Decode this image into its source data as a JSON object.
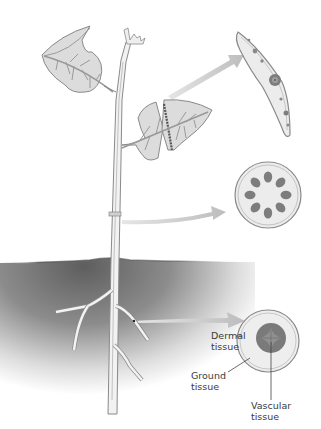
{
  "diagram": {
    "parts": [
      "leaf",
      "stem",
      "root"
    ],
    "cross_sections": [
      {
        "name": "leaf-cross-section",
        "source": "leaf"
      },
      {
        "name": "stem-cross-section",
        "source": "stem"
      },
      {
        "name": "root-cross-section",
        "source": "root"
      }
    ],
    "labels": {
      "dermal": "Dermal\ntissue",
      "dermal_line1": "Dermal",
      "dermal_line2": "tissue",
      "ground_line1": "Ground",
      "ground_line2": "tissue",
      "vascular_line1": "Vascular",
      "vascular_line2": "tissue"
    },
    "colors": {
      "outline": "#8a8a8a",
      "leaf_fill": "#dcdcdc",
      "vein": "#9a9a9a",
      "soil_dark": "#6e6e6e",
      "arrow": "#cfcfcf",
      "vascular_bundle": "#7d7d7d",
      "section_fill": "#ececec"
    }
  }
}
